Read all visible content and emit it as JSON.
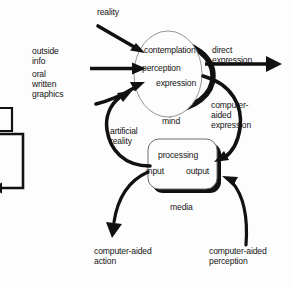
{
  "diagram": {
    "background_color": "#fdfdfd",
    "ink_color": "#111111",
    "nodes": {
      "mind": {
        "shape": "ellipse",
        "caption": "mind",
        "items": [
          "contemplation",
          "perception",
          "expression"
        ]
      },
      "media": {
        "shape": "rounded-rectangle",
        "caption": "media",
        "items": [
          "processing",
          "input",
          "output"
        ]
      },
      "partial_left_box": {
        "shape": "rectangle-fragment",
        "caption": ""
      }
    },
    "inputs": {
      "reality": "reality",
      "outside": "outside",
      "info": "info",
      "oral": "oral",
      "written": "written",
      "graphics": "graphics"
    },
    "edge_labels": {
      "direct_expression_line1": "direct",
      "direct_expression_line2": "expression",
      "computer_aided_expression_line1": "computer-",
      "computer_aided_expression_line2": "aided",
      "computer_aided_expression_line3": "expression",
      "artificial_reality_line1": "artificial",
      "artificial_reality_line2": "reality",
      "computer_aided_action_line1": "computer-aided",
      "computer_aided_action_line2": "action",
      "computer_aided_perception_line1": "computer-aided",
      "computer_aided_perception_line2": "perception"
    }
  }
}
